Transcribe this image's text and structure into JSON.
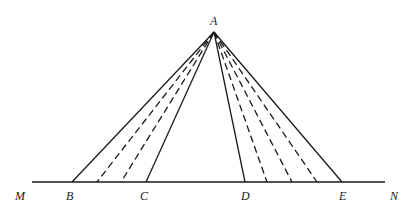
{
  "diagram": {
    "apex": {
      "label": "A",
      "x": 214,
      "y": 32
    },
    "baseline": {
      "y": 182,
      "x1": 32,
      "x2": 385,
      "start_label": "M",
      "end_label": "N"
    },
    "base_points": [
      {
        "label": "B",
        "x": 72
      },
      {
        "label": "C",
        "x": 146
      },
      {
        "label": "D",
        "x": 245
      },
      {
        "label": "E",
        "x": 342
      }
    ],
    "solid_lines_to": [
      "B",
      "C",
      "D",
      "E"
    ],
    "dashed_lines_x": [
      97,
      121,
      267,
      292,
      317
    ],
    "colors": {
      "stroke": "#1a1a1a",
      "background": "#ffffff"
    }
  }
}
